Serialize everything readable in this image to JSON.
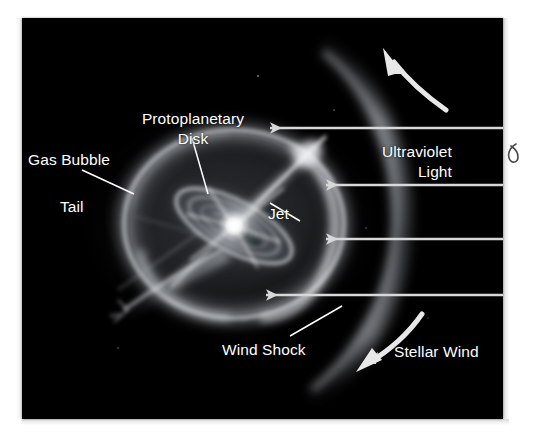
{
  "figure": {
    "domain": "scientific-diagram",
    "panel": {
      "background_color": "#000000",
      "page_background_color": "#ffffff",
      "label_color": "#ffffff",
      "x": 22,
      "y": 18,
      "width": 481,
      "height": 401
    }
  },
  "labels": {
    "protoplanetary_disk": {
      "line1": "Protoplanetary",
      "line2": "Disk"
    },
    "gas_bubble": "Gas Bubble",
    "tail": "Tail",
    "jet": "Jet",
    "ultraviolet_light": {
      "line1": "Ultraviolet",
      "line2": "Light"
    },
    "wind_shock": "Wind Shock",
    "stellar_wind": "Stellar Wind"
  },
  "annotations": {
    "uv_arrows": {
      "count": 4,
      "direction": "left",
      "color": "#d8d8d8",
      "description": "Four straight horizontal arrows pointing left, entering from the right edge toward the gas bubble"
    },
    "rotation_arrow": {
      "direction": "up-left",
      "color": "#e8e8e8",
      "description": "Curved arrow at upper right sweeping up and to the left"
    },
    "stellar_wind_arrow": {
      "direction": "down-left",
      "color": "#e8e8e8",
      "description": "Curved arrow at lower right sweeping down and to the left"
    },
    "leader_lines": [
      {
        "for": "protoplanetary_disk",
        "from": "label-bottom",
        "to": "disk-edge"
      },
      {
        "for": "gas_bubble",
        "from": "label-right",
        "to": "bubble-left-edge"
      },
      {
        "for": "jet",
        "from": "label-left",
        "to": "jet-axis"
      },
      {
        "for": "wind_shock",
        "from": "label-right",
        "to": "shock-arc"
      }
    ],
    "edge_mark": {
      "name": "hook-glyph",
      "description": "small dark hook-shaped scan mark at right page edge"
    }
  }
}
